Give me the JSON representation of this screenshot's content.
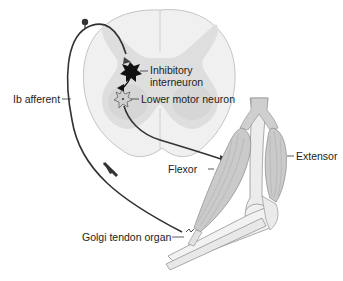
{
  "diagram": {
    "type": "anatomy-reflex-circuit",
    "colors": {
      "background": "#ffffff",
      "white_matter": "#efefef",
      "gray_matter": "#dcdcdc",
      "outline": "#b5b5b5",
      "nerve": "#333333",
      "muscle": "#c8c8c8",
      "bone": "#f1f1f1"
    },
    "labels": {
      "inhibitory_interneuron_line1": "Inhibitory",
      "inhibitory_interneuron_line2": "interneuron",
      "lower_motor_neuron": "Lower motor neuron",
      "ib_afferent": "Ib afferent",
      "flexor": "Flexor",
      "extensor": "Extensor",
      "golgi_tendon_organ": "Golgi tendon organ"
    }
  }
}
